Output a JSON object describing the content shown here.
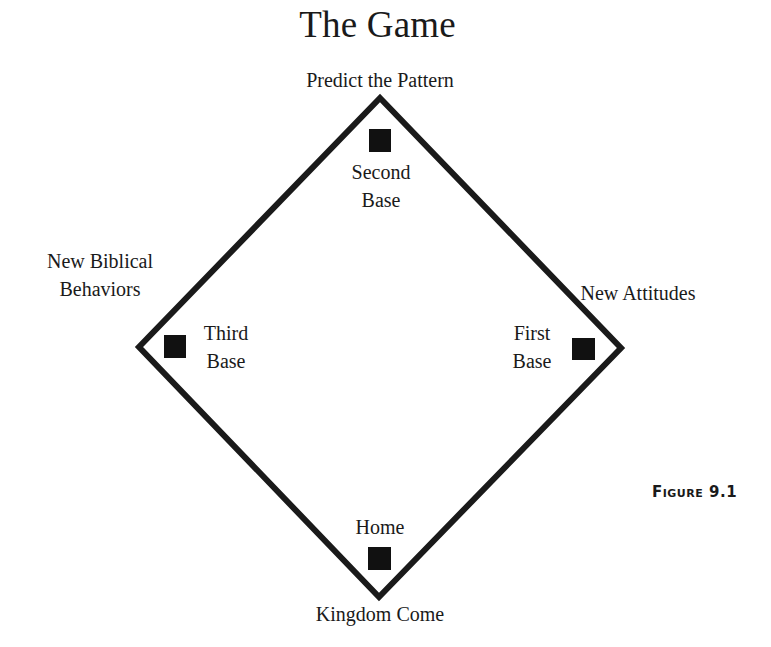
{
  "title": "The Game",
  "figure_label": {
    "word": "Figure",
    "number": "9.1"
  },
  "colors": {
    "ink": "#1a1a1a",
    "background": "#ffffff"
  },
  "diamond": {
    "vertices": {
      "top": [
        380,
        98
      ],
      "right": [
        621,
        348
      ],
      "bottom": [
        379,
        597
      ],
      "left": [
        139,
        347
      ]
    },
    "stroke_width": 6
  },
  "bases": {
    "second": {
      "name": "Second Base",
      "lines": [
        "Second",
        "Base"
      ],
      "square": [
        369,
        129,
        22,
        23
      ]
    },
    "third": {
      "name": "Third Base",
      "lines": [
        "Third",
        "Base"
      ],
      "square": [
        164,
        335,
        22,
        23
      ]
    },
    "first": {
      "name": "First Base",
      "lines": [
        "First",
        "Base"
      ],
      "square": [
        572,
        338,
        23,
        22
      ]
    },
    "home": {
      "name": "Home",
      "lines": [
        "Home"
      ],
      "square": [
        368,
        547,
        23,
        23
      ]
    }
  },
  "outer_labels": {
    "top": "Predict the Pattern",
    "left": [
      "New Biblical",
      "Behaviors"
    ],
    "right": "New Attitudes",
    "bottom": "Kingdom Come"
  }
}
